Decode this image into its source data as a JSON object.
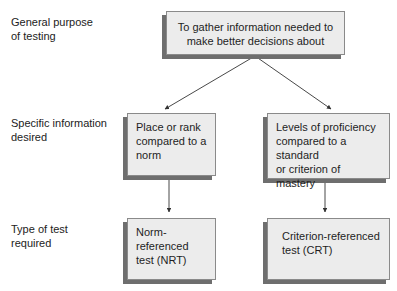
{
  "row_labels": {
    "general": "General purpose\nof testing",
    "specific": "Specific information\ndesired",
    "type": "Type of test\nrequired"
  },
  "nodes": {
    "purpose": "To gather information needed to\nmake better decisions about",
    "norm_info": "Place or rank\ncompared to a\nnorm",
    "criterion_info": "Levels of proficiency\ncompared to a standard\nor criterion of mastery",
    "nrt": "Norm-referenced\ntest (NRT)",
    "crt": "Criterion-referenced\ntest (CRT)"
  },
  "edges": [
    {
      "from": "purpose",
      "to": "norm_info"
    },
    {
      "from": "purpose",
      "to": "criterion_info"
    },
    {
      "from": "norm_info",
      "to": "nrt"
    },
    {
      "from": "criterion_info",
      "to": "crt"
    }
  ],
  "colors": {
    "box_fill": "#ececec",
    "box_border": "#8a8a8a",
    "shadow": "#6e6e6e",
    "line": "#333333"
  }
}
